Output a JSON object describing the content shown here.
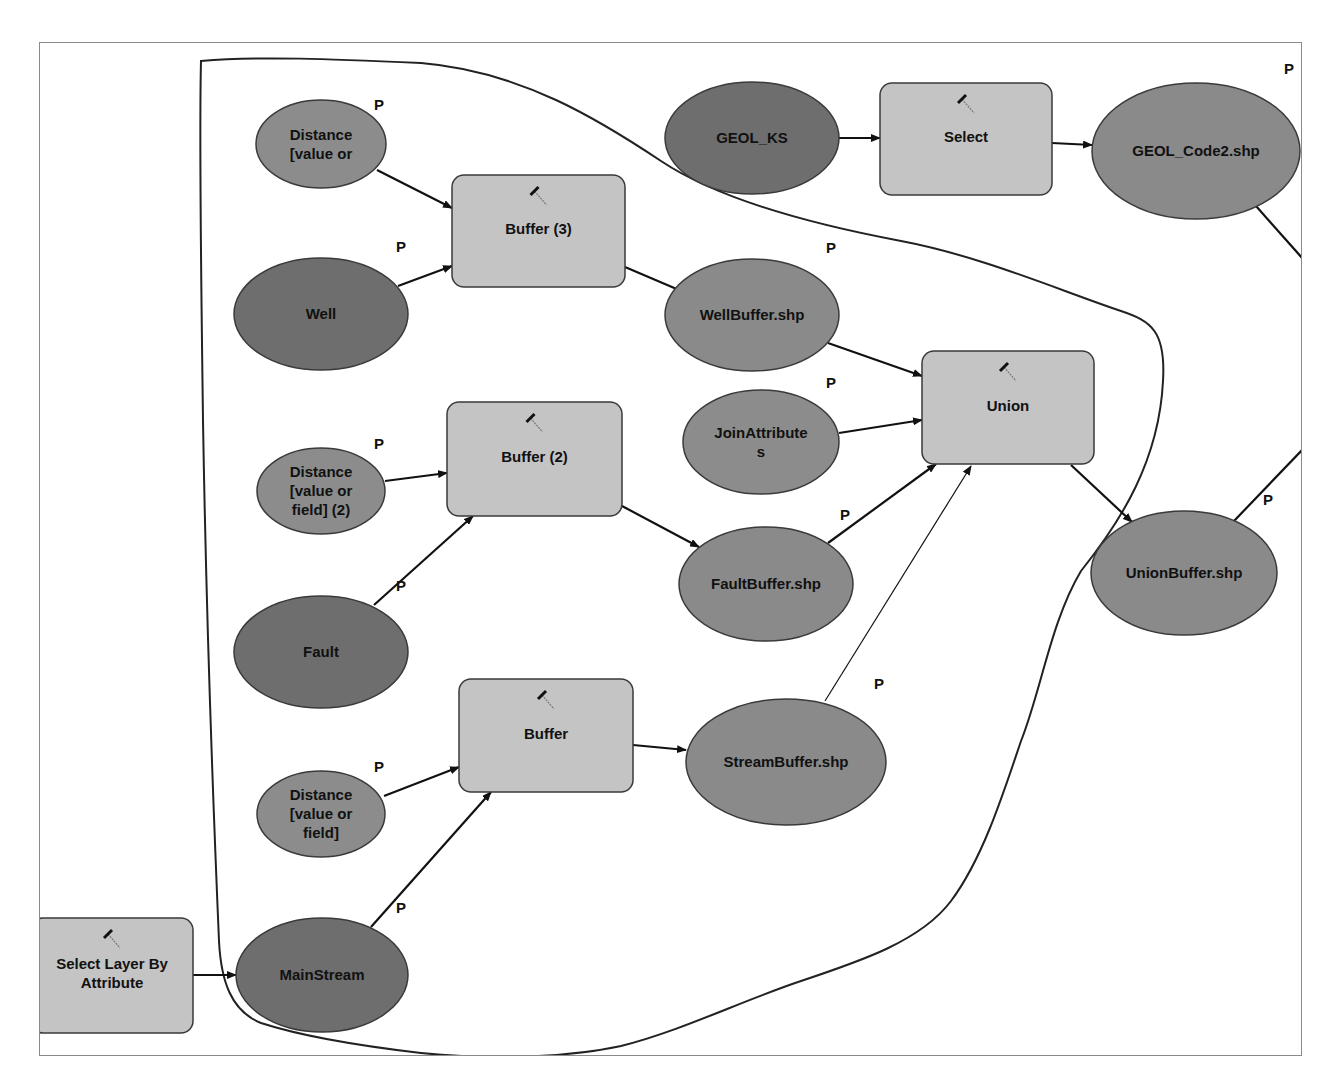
{
  "diagram": {
    "colors": {
      "input_data": "#6e6e6e",
      "parameter": "#8c8c8c",
      "derived_data": "#8a8a8a",
      "tool": "#c4c4c4",
      "stroke": "#3a3a3a",
      "outline": "#222222"
    },
    "parameter_marker": "P",
    "nodes": [
      {
        "id": "distance3",
        "type": "parameter",
        "shape": "ellipse",
        "lines": [
          "Distance",
          "[value or"
        ],
        "cx": 320,
        "cy": 143,
        "rx": 65,
        "ry": 44,
        "p": {
          "x": 373,
          "y": 109
        }
      },
      {
        "id": "well",
        "type": "input_data",
        "shape": "ellipse",
        "lines": [
          "Well"
        ],
        "cx": 320,
        "cy": 313,
        "rx": 87,
        "ry": 56,
        "p": {
          "x": 395,
          "y": 251
        }
      },
      {
        "id": "buffer3",
        "type": "tool",
        "shape": "rect",
        "lines": [
          "Buffer (3)"
        ],
        "x": 451,
        "y": 174,
        "w": 173,
        "h": 112
      },
      {
        "id": "distance2",
        "type": "parameter",
        "shape": "ellipse",
        "lines": [
          "Distance",
          "[value or",
          "field] (2)"
        ],
        "cx": 320,
        "cy": 490,
        "rx": 64,
        "ry": 43,
        "p": {
          "x": 373,
          "y": 448
        }
      },
      {
        "id": "buffer2",
        "type": "tool",
        "shape": "rect",
        "lines": [
          "Buffer (2)"
        ],
        "x": 446,
        "y": 401,
        "w": 175,
        "h": 114
      },
      {
        "id": "fault",
        "type": "input_data",
        "shape": "ellipse",
        "lines": [
          "Fault"
        ],
        "cx": 320,
        "cy": 651,
        "rx": 87,
        "ry": 56,
        "p": {
          "x": 395,
          "y": 590
        }
      },
      {
        "id": "distance1",
        "type": "parameter",
        "shape": "ellipse",
        "lines": [
          "Distance",
          "[value or",
          "field]"
        ],
        "cx": 320,
        "cy": 813,
        "rx": 64,
        "ry": 43,
        "p": {
          "x": 373,
          "y": 771
        }
      },
      {
        "id": "buffer1",
        "type": "tool",
        "shape": "rect",
        "lines": [
          "Buffer"
        ],
        "x": 458,
        "y": 678,
        "w": 174,
        "h": 113
      },
      {
        "id": "select_layer",
        "type": "tool",
        "shape": "rect",
        "lines": [
          "Select Layer By",
          "Attribute"
        ],
        "x": 30,
        "y": 917,
        "w": 162,
        "h": 115
      },
      {
        "id": "mainstream",
        "type": "input_data",
        "shape": "ellipse",
        "lines": [
          "MainStream"
        ],
        "cx": 321,
        "cy": 974,
        "rx": 86,
        "ry": 57,
        "p": {
          "x": 395,
          "y": 912
        }
      },
      {
        "id": "geol_ks",
        "type": "input_data",
        "shape": "ellipse",
        "lines": [
          "GEOL_KS"
        ],
        "cx": 751,
        "cy": 137,
        "rx": 87,
        "ry": 56
      },
      {
        "id": "select",
        "type": "tool",
        "shape": "rect",
        "lines": [
          "Select"
        ],
        "x": 879,
        "y": 82,
        "w": 172,
        "h": 112
      },
      {
        "id": "geol_code2",
        "type": "derived_data",
        "shape": "ellipse",
        "lines": [
          "GEOL_Code2.shp"
        ],
        "cx": 1195,
        "cy": 150,
        "rx": 104,
        "ry": 68,
        "p": {
          "x": 1283,
          "y": 73
        }
      },
      {
        "id": "wellbuffer",
        "type": "derived_data",
        "shape": "ellipse",
        "lines": [
          "WellBuffer.shp"
        ],
        "cx": 751,
        "cy": 314,
        "rx": 87,
        "ry": 56,
        "p": {
          "x": 825,
          "y": 252
        }
      },
      {
        "id": "joinattributes",
        "type": "parameter",
        "shape": "ellipse",
        "lines": [
          "JoinAttribute",
          "s"
        ],
        "cx": 760,
        "cy": 441,
        "rx": 78,
        "ry": 52,
        "p": {
          "x": 825,
          "y": 387
        }
      },
      {
        "id": "union",
        "type": "tool",
        "shape": "rect",
        "lines": [
          "Union"
        ],
        "x": 921,
        "y": 350,
        "w": 172,
        "h": 113
      },
      {
        "id": "faultbuffer",
        "type": "derived_data",
        "shape": "ellipse",
        "lines": [
          "FaultBuffer.shp"
        ],
        "cx": 765,
        "cy": 583,
        "rx": 87,
        "ry": 57,
        "p": {
          "x": 839,
          "y": 519
        }
      },
      {
        "id": "streambuffer",
        "type": "derived_data",
        "shape": "ellipse",
        "lines": [
          "StreamBuffer.shp"
        ],
        "cx": 785,
        "cy": 761,
        "rx": 100,
        "ry": 63,
        "p": {
          "x": 873,
          "y": 688
        }
      },
      {
        "id": "unionbuffer",
        "type": "derived_data",
        "shape": "ellipse",
        "lines": [
          "UnionBuffer.shp"
        ],
        "cx": 1183,
        "cy": 572,
        "rx": 93,
        "ry": 62,
        "p": {
          "x": 1262,
          "y": 504
        }
      }
    ],
    "connectors": [
      {
        "from": "distance3",
        "to": "buffer3",
        "x1": 376,
        "y1": 169,
        "x2": 451,
        "y2": 207,
        "arrow": true
      },
      {
        "from": "well",
        "to": "buffer3",
        "x1": 397,
        "y1": 285,
        "x2": 451,
        "y2": 265,
        "arrow": true
      },
      {
        "from": "buffer3",
        "to": "wellbuffer",
        "x1": 624,
        "y1": 266,
        "x2": 685,
        "y2": 292,
        "arrow": true
      },
      {
        "from": "distance2",
        "to": "buffer2",
        "x1": 384,
        "y1": 480,
        "x2": 446,
        "y2": 472,
        "arrow": true
      },
      {
        "from": "fault",
        "to": "buffer2",
        "x1": 373,
        "y1": 604,
        "x2": 472,
        "y2": 515,
        "arrow": true
      },
      {
        "from": "buffer2",
        "to": "faultbuffer",
        "x1": 621,
        "y1": 505,
        "x2": 698,
        "y2": 546,
        "arrow": true
      },
      {
        "from": "distance1",
        "to": "buffer1",
        "x1": 383,
        "y1": 795,
        "x2": 458,
        "y2": 766,
        "arrow": true
      },
      {
        "from": "mainstream",
        "to": "buffer1",
        "x1": 370,
        "y1": 926,
        "x2": 490,
        "y2": 791,
        "arrow": true
      },
      {
        "from": "buffer1",
        "to": "streambuffer",
        "x1": 632,
        "y1": 744,
        "x2": 685,
        "y2": 749,
        "arrow": true
      },
      {
        "from": "select_layer",
        "to": "mainstream",
        "x1": 192,
        "y1": 974,
        "x2": 235,
        "y2": 974,
        "arrow": true
      },
      {
        "from": "geol_ks",
        "to": "select",
        "x1": 838,
        "y1": 137,
        "x2": 879,
        "y2": 137,
        "arrow": true
      },
      {
        "from": "select",
        "to": "geol_code2",
        "x1": 1051,
        "y1": 142,
        "x2": 1091,
        "y2": 144,
        "arrow": true
      },
      {
        "from": "wellbuffer",
        "to": "union",
        "x1": 827,
        "y1": 342,
        "x2": 921,
        "y2": 375,
        "arrow": true
      },
      {
        "from": "joinattributes",
        "to": "union",
        "x1": 838,
        "y1": 432,
        "x2": 921,
        "y2": 419,
        "arrow": true
      },
      {
        "from": "faultbuffer",
        "to": "union",
        "x1": 827,
        "y1": 542,
        "x2": 935,
        "y2": 463,
        "arrow": true
      },
      {
        "from": "streambuffer",
        "to": "union",
        "x1": 824,
        "y1": 700,
        "x2": 970,
        "y2": 465,
        "arrow": true,
        "thin": true
      },
      {
        "from": "union",
        "to": "unionbuffer",
        "x1": 1070,
        "y1": 464,
        "x2": 1131,
        "y2": 521,
        "arrow": true
      },
      {
        "from": "geol_code2",
        "to": "offscreen",
        "x1": 1255,
        "y1": 205,
        "x2": 1302,
        "y2": 258,
        "arrow": false
      },
      {
        "from": "unionbuffer",
        "to": "offscreen",
        "x1": 1233,
        "y1": 520,
        "x2": 1302,
        "y2": 448,
        "arrow": false
      }
    ],
    "annotation_outline": {
      "description": "Hand-drawn freeform outline enclosing the buffer/union section",
      "path": "M 200 60 C 260 55 330 58 420 62 C 520 70 600 120 660 160 C 720 200 820 225 900 240 C 980 255 1060 290 1120 310 C 1150 320 1165 330 1162 380 C 1158 460 1120 520 1080 570 C 1050 620 1040 690 1020 740 C 1000 800 980 860 950 900 C 920 940 860 960 800 980 C 740 1000 680 1030 620 1045 C 560 1058 480 1058 420 1052 C 360 1045 300 1035 260 1022 C 230 1010 220 980 218 940 C 212 800 205 600 202 420 C 200 260 198 140 200 60 Z"
    }
  }
}
